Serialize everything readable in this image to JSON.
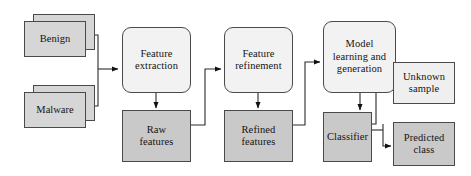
{
  "diagram": {
    "canvas": {
      "width": 471,
      "height": 176,
      "background": "#ffffff"
    },
    "palette": {
      "process_fill": "#f2f2f2",
      "data_fill": "#c9c9c9",
      "light_fill": "#efefef",
      "stack_fill": "#d6d6d6",
      "stroke": "#4a4a4a",
      "text": "#141414"
    },
    "nodes": {
      "benign": {
        "label": "Benign",
        "shape": "stacked-rectangle"
      },
      "malware": {
        "label": "Malware",
        "shape": "stacked-rectangle"
      },
      "feature_extraction": {
        "line1": "Feature",
        "line2": "extraction",
        "shape": "rounded-rectangle"
      },
      "raw_features": {
        "line1": "Raw",
        "line2": "features",
        "shape": "rectangle"
      },
      "feature_refinement": {
        "line1": "Feature",
        "line2": "refinement",
        "shape": "rounded-rectangle"
      },
      "refined_features": {
        "line1": "Refined",
        "line2": "features",
        "shape": "rectangle"
      },
      "model_learning": {
        "line1": "Model",
        "line2": "learning and",
        "line3": "generation",
        "shape": "rounded-rectangle"
      },
      "classifier": {
        "label": "Classifier",
        "shape": "rectangle"
      },
      "unknown_sample": {
        "line1": "Unknown",
        "line2": "sample",
        "shape": "rectangle"
      },
      "predicted_class": {
        "line1": "Predicted",
        "line2": "class",
        "shape": "rectangle"
      }
    },
    "edges": [
      {
        "from": "benign",
        "to": "feature_extraction"
      },
      {
        "from": "malware",
        "to": "feature_extraction"
      },
      {
        "from": "feature_extraction",
        "to": "raw_features"
      },
      {
        "from": "raw_features",
        "to": "feature_refinement"
      },
      {
        "from": "feature_refinement",
        "to": "refined_features"
      },
      {
        "from": "refined_features",
        "to": "model_learning"
      },
      {
        "from": "model_learning",
        "to": "classifier"
      },
      {
        "from": "unknown_sample",
        "to": "classifier"
      },
      {
        "from": "classifier",
        "to": "predicted_class"
      }
    ]
  }
}
